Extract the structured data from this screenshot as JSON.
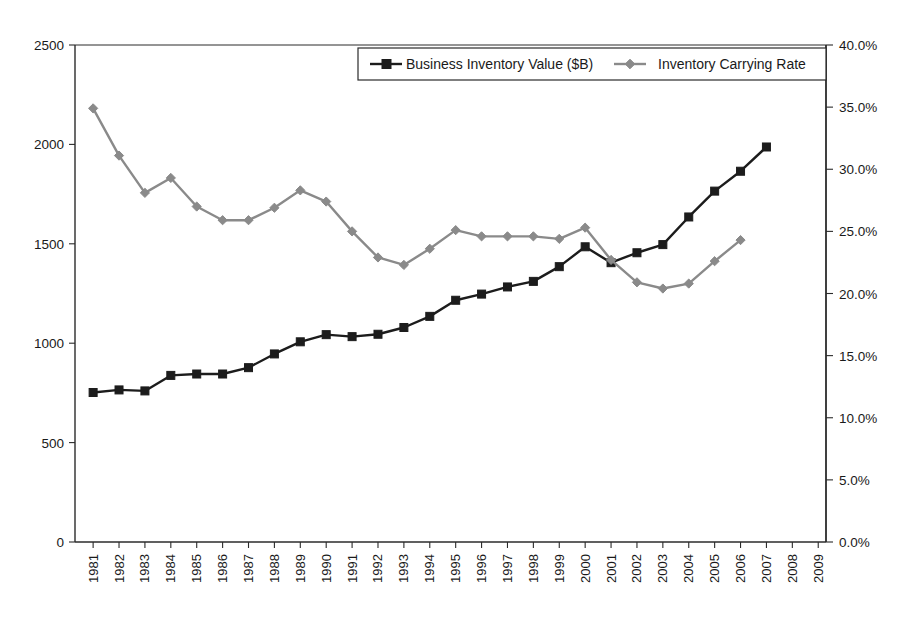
{
  "chart_data": {
    "type": "line",
    "title": "",
    "subtitle": "",
    "xlabel": "",
    "ylabel": "",
    "grid": false,
    "legend_position": "top-center",
    "x": [
      1981,
      1982,
      1983,
      1984,
      1985,
      1986,
      1987,
      1988,
      1989,
      1990,
      1991,
      1992,
      1993,
      1994,
      1995,
      1996,
      1997,
      1998,
      1999,
      2000,
      2001,
      2002,
      2003,
      2004,
      2005,
      2006,
      2007,
      2008,
      2009
    ],
    "xtick_labels": [
      "1981",
      "1982",
      "1983",
      "1984",
      "1985",
      "1986",
      "1987",
      "1988",
      "1989",
      "1990",
      "1991",
      "1992",
      "1993",
      "1994",
      "1995",
      "1996",
      "1997",
      "1998",
      "1999",
      "2000",
      "2001",
      "2002",
      "2003",
      "2004",
      "2005",
      "2006",
      "2007",
      "2008",
      "2009"
    ],
    "axes": {
      "left": {
        "label": "",
        "min": 0,
        "max": 2500,
        "ticks": [
          0,
          500,
          1000,
          1500,
          2000,
          2500
        ],
        "tick_labels": [
          "0",
          "500",
          "1000",
          "1500",
          "2000",
          "2500"
        ]
      },
      "right": {
        "label": "",
        "min": 0,
        "max": 0.4,
        "ticks": [
          0.0,
          0.05,
          0.1,
          0.15,
          0.2,
          0.25,
          0.3,
          0.35,
          0.4
        ],
        "tick_labels": [
          "0.0%",
          "5.0%",
          "10.0%",
          "15.0%",
          "20.0%",
          "25.0%",
          "30.0%",
          "35.0%",
          "40.0%"
        ]
      }
    },
    "series": [
      {
        "name": "Business Inventory Value ($B)",
        "axis": "left",
        "color": "#1c1c1c",
        "marker": "square",
        "x": [
          1981,
          1982,
          1983,
          1984,
          1985,
          1986,
          1987,
          1988,
          1989,
          1990,
          1991,
          1992,
          1993,
          1994,
          1995,
          1996,
          1997,
          1998,
          1999,
          2000,
          2001,
          2002,
          2003,
          2004,
          2005,
          2006,
          2007
        ],
        "values": [
          752,
          765,
          760,
          838,
          845,
          845,
          877,
          946,
          1007,
          1043,
          1033,
          1045,
          1079,
          1135,
          1216,
          1247,
          1283,
          1311,
          1385,
          1485,
          1405,
          1455,
          1496,
          1635,
          1765,
          1865,
          1987
        ]
      },
      {
        "name": "Inventory Carrying Rate",
        "axis": "right",
        "color": "#8a8a8a",
        "marker": "diamond",
        "x": [
          1981,
          1982,
          1983,
          1984,
          1985,
          1986,
          1987,
          1988,
          1989,
          1990,
          1991,
          1992,
          1993,
          1994,
          1995,
          1996,
          1997,
          1998,
          1999,
          2000,
          2001,
          2002,
          2003,
          2004,
          2005,
          2006
        ],
        "values": [
          0.349,
          0.311,
          0.281,
          0.293,
          0.27,
          0.259,
          0.259,
          0.269,
          0.283,
          0.274,
          0.25,
          0.229,
          0.223,
          0.236,
          0.251,
          0.246,
          0.246,
          0.246,
          0.244,
          0.253,
          0.227,
          0.209,
          0.204,
          0.208,
          0.226,
          0.243
        ]
      }
    ],
    "legend": [
      {
        "label": "Business Inventory Value ($B)",
        "color": "#1c1c1c",
        "marker": "square"
      },
      {
        "label": "Inventory Carrying Rate",
        "color": "#8a8a8a",
        "marker": "diamond"
      }
    ]
  }
}
